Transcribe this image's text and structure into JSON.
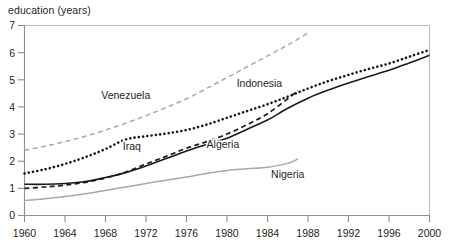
{
  "chart_data": {
    "type": "line",
    "title": "education (years)",
    "xlabel": "",
    "ylabel": "education (years)",
    "xlim": [
      1960,
      2000
    ],
    "ylim": [
      0,
      7
    ],
    "grid": false,
    "legend": "inline-labels",
    "y_ticks": [
      "0",
      "1",
      "2",
      "3",
      "4",
      "5",
      "6",
      "7"
    ],
    "x_ticks": [
      "1960",
      "1964",
      "1968",
      "1972",
      "1976",
      "1980",
      "1984",
      "1988",
      "1992",
      "1996",
      "2000"
    ],
    "series": [
      {
        "name": "Venezuela",
        "style": "dashed",
        "color": "#a9a9a9",
        "width": 1.5,
        "label_x": 1970.0,
        "label_y": 4.28,
        "x": [
          1960,
          1962,
          1964,
          1966,
          1968,
          1970,
          1972,
          1974,
          1976,
          1978,
          1980,
          1982,
          1984,
          1986,
          1988
        ],
        "values": [
          2.4,
          2.55,
          2.72,
          2.92,
          3.15,
          3.4,
          3.68,
          3.98,
          4.3,
          4.68,
          5.08,
          5.48,
          5.88,
          6.28,
          6.72
        ]
      },
      {
        "name": "Indonesia",
        "style": "dotted",
        "color": "#1a1a1a",
        "width": 2.6,
        "label_x": 1983.2,
        "label_y": 4.72,
        "x": [
          1960,
          1962,
          1964,
          1966,
          1968,
          1970,
          1972,
          1974,
          1976,
          1978,
          1980,
          1982,
          1984,
          1986,
          1988,
          1990,
          1992,
          1994,
          1996,
          1998,
          2000
        ],
        "values": [
          1.55,
          1.7,
          1.9,
          2.15,
          2.45,
          2.8,
          2.92,
          3.02,
          3.15,
          3.35,
          3.6,
          3.85,
          4.1,
          4.38,
          4.68,
          4.95,
          5.18,
          5.4,
          5.6,
          5.85,
          6.1
        ]
      },
      {
        "name": "Iraq",
        "style": "dashed",
        "color": "#1a1a1a",
        "width": 1.7,
        "label_x": 1970.6,
        "label_y": 2.42,
        "x": [
          1960,
          1962,
          1964,
          1966,
          1968,
          1970,
          1972,
          1974,
          1976,
          1978,
          1980,
          1982,
          1984,
          1986,
          1987
        ],
        "values": [
          1.0,
          1.05,
          1.12,
          1.22,
          1.38,
          1.6,
          1.9,
          2.18,
          2.48,
          2.72,
          3.0,
          3.35,
          3.75,
          4.3,
          4.6
        ]
      },
      {
        "name": "Algeria",
        "style": "solid",
        "color": "#1a1a1a",
        "width": 1.6,
        "label_x": 1979.6,
        "label_y": 2.48,
        "x": [
          1960,
          1962,
          1964,
          1966,
          1968,
          1970,
          1972,
          1974,
          1976,
          1978,
          1980,
          1982,
          1984,
          1986,
          1988,
          1990,
          1992,
          1994,
          1996,
          1998,
          2000
        ],
        "values": [
          1.15,
          1.15,
          1.18,
          1.25,
          1.4,
          1.58,
          1.82,
          2.1,
          2.38,
          2.62,
          2.85,
          3.18,
          3.52,
          3.95,
          4.32,
          4.62,
          4.88,
          5.12,
          5.35,
          5.62,
          5.9
        ]
      },
      {
        "name": "Nigeria",
        "style": "solid",
        "color": "#a9a9a9",
        "width": 1.5,
        "label_x": 1986.0,
        "label_y": 1.38,
        "x": [
          1960,
          1962,
          1964,
          1966,
          1968,
          1970,
          1972,
          1974,
          1976,
          1978,
          1980,
          1982,
          1984,
          1986,
          1987
        ],
        "values": [
          0.55,
          0.62,
          0.7,
          0.8,
          0.92,
          1.05,
          1.18,
          1.3,
          1.42,
          1.55,
          1.66,
          1.72,
          1.78,
          1.92,
          2.08
        ]
      }
    ]
  }
}
